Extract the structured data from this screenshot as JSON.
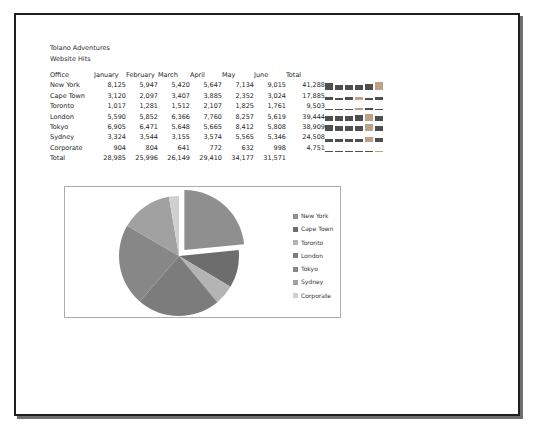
{
  "page": {
    "title_line1": "Tolano Adventures",
    "title_line2": "Website Hits"
  },
  "table": {
    "columns": [
      "Office",
      "January",
      "February",
      "March",
      "April",
      "May",
      "June",
      "Total"
    ],
    "rows": [
      {
        "office": "New York",
        "values": [
          "8,125",
          "5,947",
          "5,420",
          "5,647",
          "7,134",
          "9,015"
        ],
        "total": "41,288"
      },
      {
        "office": "Cape Town",
        "values": [
          "3,120",
          "2,097",
          "3,407",
          "3,885",
          "2,352",
          "3,024"
        ],
        "total": "17,885"
      },
      {
        "office": "Toronto",
        "values": [
          "1,017",
          "1,281",
          "1,512",
          "2,107",
          "1,825",
          "1,761"
        ],
        "total": "9,503"
      },
      {
        "office": "London",
        "values": [
          "5,590",
          "5,852",
          "6,366",
          "7,760",
          "8,257",
          "5,619"
        ],
        "total": "39,444"
      },
      {
        "office": "Tokyo",
        "values": [
          "6,905",
          "6,471",
          "5,648",
          "5,665",
          "8,412",
          "5,808"
        ],
        "total": "38,909"
      },
      {
        "office": "Sydney",
        "values": [
          "3,324",
          "3,544",
          "3,155",
          "3,574",
          "5,565",
          "5,346"
        ],
        "total": "24,508"
      },
      {
        "office": "Corporate",
        "values": [
          "904",
          "804",
          "641",
          "772",
          "632",
          "998"
        ],
        "total": "4,751"
      }
    ],
    "total_row": {
      "office": "Total",
      "values": [
        "28,985",
        "25,996",
        "26,149",
        "29,410",
        "34,177",
        "31,571"
      ],
      "total": ""
    }
  },
  "sparklines": {
    "type": "column",
    "bar_color": "#4f4f4f",
    "high_point_color": "#bda184",
    "axis_max": 9015
  },
  "chart_data": {
    "type": "pie",
    "title": "",
    "categories": [
      "New York",
      "Cape Town",
      "Toronto",
      "London",
      "Tokyo",
      "Sydney",
      "Corporate"
    ],
    "values": [
      41288,
      17885,
      9503,
      39444,
      38909,
      24508,
      4751
    ],
    "colors": [
      "#8f8f8f",
      "#6d6d6d",
      "#b4b4b4",
      "#7c7c7c",
      "#878787",
      "#a1a1a1",
      "#d0d0d0"
    ],
    "exploded_slice": "New York",
    "explode_offset_px": 8,
    "legend_position": "right",
    "start_angle_deg": 0,
    "direction": "clockwise"
  }
}
